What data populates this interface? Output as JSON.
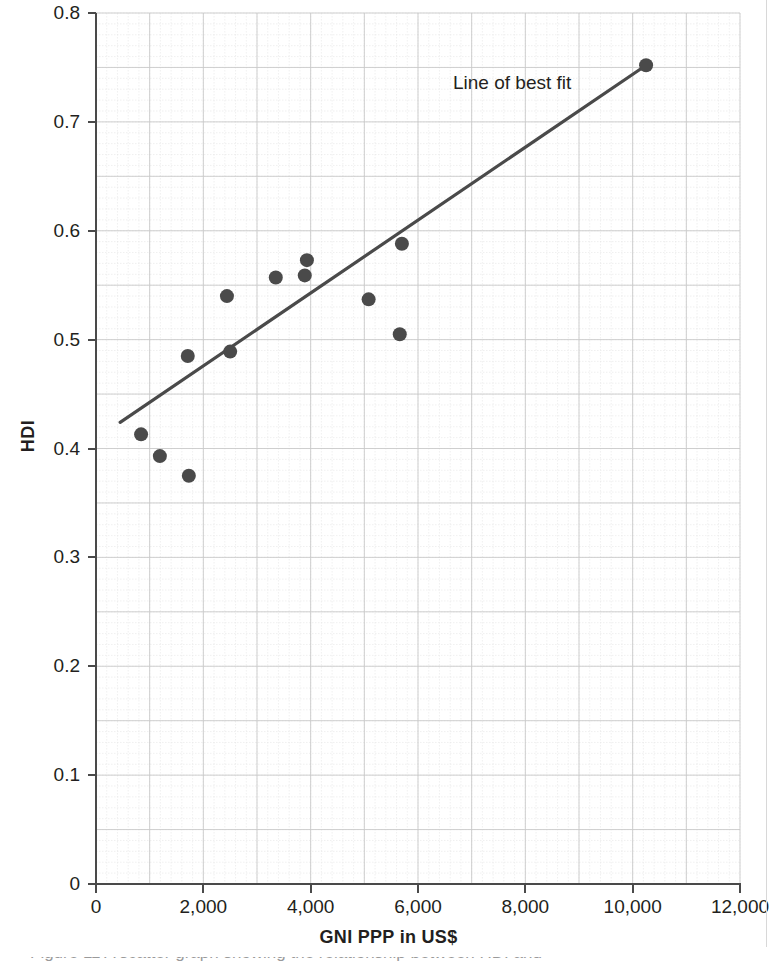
{
  "chart_data": {
    "type": "scatter",
    "title": "",
    "xlabel": "GNI PPP in US$",
    "ylabel": "HDI",
    "xlim": [
      0,
      12000
    ],
    "ylim": [
      0,
      0.8
    ],
    "xticks": [
      0,
      2000,
      4000,
      6000,
      8000,
      10000,
      12000
    ],
    "xticklabels": [
      "0",
      "2,000",
      "4,000",
      "6,000",
      "8,000",
      "10,000",
      "12,000"
    ],
    "yticks": [
      0,
      0.1,
      0.2,
      0.3,
      0.4,
      0.5,
      0.6,
      0.7,
      0.8
    ],
    "yticklabels": [
      "0",
      "0.1",
      "0.2",
      "0.3",
      "0.4",
      "0.5",
      "0.6",
      "0.7",
      "0.8"
    ],
    "grid": true,
    "grid_major_x_step": 1000,
    "grid_major_y_step": 0.05,
    "grid_minor_x_step": 200,
    "grid_minor_y_step": 0.01,
    "legend": "none",
    "marker_color": "#4a4a4a",
    "marker_size_px": 14,
    "points": [
      {
        "x": 840,
        "y": 0.413
      },
      {
        "x": 1190,
        "y": 0.393
      },
      {
        "x": 1730,
        "y": 0.375
      },
      {
        "x": 1710,
        "y": 0.485
      },
      {
        "x": 2440,
        "y": 0.54
      },
      {
        "x": 2500,
        "y": 0.489
      },
      {
        "x": 3350,
        "y": 0.557
      },
      {
        "x": 3890,
        "y": 0.559
      },
      {
        "x": 3930,
        "y": 0.573
      },
      {
        "x": 5080,
        "y": 0.537
      },
      {
        "x": 5660,
        "y": 0.505
      },
      {
        "x": 5700,
        "y": 0.588
      },
      {
        "x": 10250,
        "y": 0.752
      }
    ],
    "trendline": {
      "label": "Line of best fit",
      "color": "#4a4a4a",
      "x_start": 450,
      "y_start": 0.424,
      "x_end": 10250,
      "y_end": 0.752
    }
  },
  "annotations": {
    "best_fit_label": "Line of best fit"
  },
  "axes": {
    "x_title": "GNI PPP in US$",
    "y_title": "HDI"
  },
  "caption": {
    "text": "Figure 11 A scatter graph showing the relationship between HDI and"
  },
  "colors": {
    "marker": "#4a4a4a",
    "line": "#4a4a4a",
    "axis": "#4a4a4a",
    "grid_major": "#c9c9c9",
    "grid_minor": "#e6e6e6",
    "text": "#231f20",
    "background": "#ffffff"
  }
}
